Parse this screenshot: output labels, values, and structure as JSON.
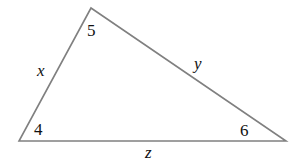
{
  "diagram": {
    "type": "triangle",
    "line_color": "#808080",
    "vertices": {
      "top": [
        91,
        8
      ],
      "bottom_left": [
        19,
        141
      ],
      "bottom_right": [
        286,
        141
      ]
    },
    "angles": {
      "top": "5",
      "bottom_left": "4",
      "bottom_right": "6"
    },
    "sides": {
      "left": "x",
      "right": "y",
      "bottom": "z"
    }
  }
}
